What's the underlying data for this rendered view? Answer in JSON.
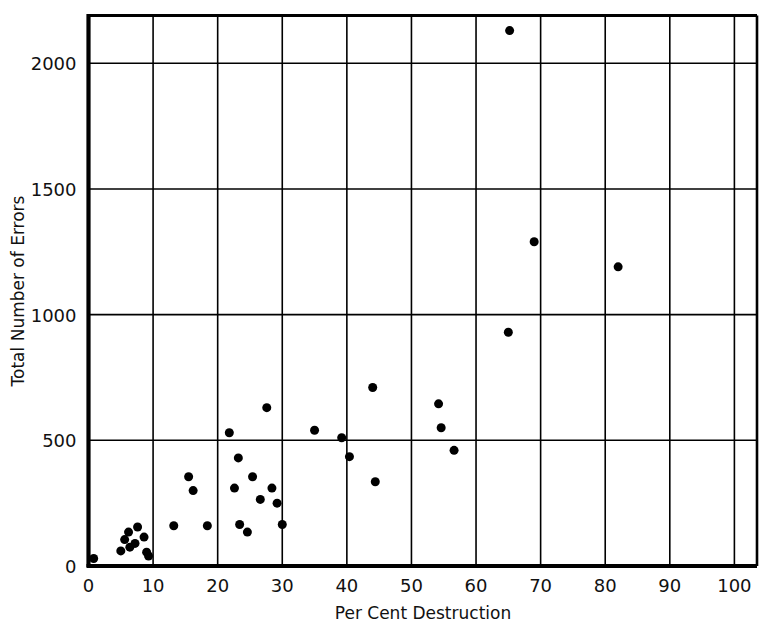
{
  "figure": {
    "background_color": "#ffffff",
    "ink_color": "#000000"
  },
  "chart_data": {
    "type": "scatter",
    "title": "",
    "subtitle": "",
    "xlabel": "Per Cent Destruction",
    "ylabel": "Total Number of Errors",
    "xlim": [
      0,
      103.5
    ],
    "ylim": [
      0,
      2190
    ],
    "grid": true,
    "grid_style": "full rectangular grid, major gridlines only",
    "legend": "none",
    "marker": {
      "shape": "circle",
      "color": "#000000",
      "filled": true,
      "size_px": 9
    },
    "xticks": [
      0,
      10,
      20,
      30,
      40,
      50,
      60,
      70,
      80,
      90,
      100
    ],
    "xtick_labels": [
      "0",
      "10",
      "20",
      "30",
      "40",
      "50",
      "60",
      "70",
      "80",
      "90",
      "100"
    ],
    "yticks": [
      0,
      500,
      1000,
      1500,
      2000
    ],
    "ytick_labels": [
      "0",
      "500",
      "1000",
      "1500",
      "2000"
    ],
    "x_gridlines": [
      10,
      20,
      30,
      40,
      50,
      60,
      70,
      80,
      90,
      100
    ],
    "y_gridlines": [
      500,
      1000,
      1500,
      2000
    ],
    "n_points": 35,
    "points": [
      {
        "x": 0.8,
        "y": 30
      },
      {
        "x": 5.0,
        "y": 60
      },
      {
        "x": 5.6,
        "y": 105
      },
      {
        "x": 6.2,
        "y": 135
      },
      {
        "x": 6.4,
        "y": 75
      },
      {
        "x": 7.2,
        "y": 90
      },
      {
        "x": 7.6,
        "y": 155
      },
      {
        "x": 8.6,
        "y": 115
      },
      {
        "x": 9.0,
        "y": 55
      },
      {
        "x": 9.3,
        "y": 40
      },
      {
        "x": 13.2,
        "y": 160
      },
      {
        "x": 15.5,
        "y": 355
      },
      {
        "x": 16.2,
        "y": 300
      },
      {
        "x": 18.4,
        "y": 160
      },
      {
        "x": 21.8,
        "y": 530
      },
      {
        "x": 22.6,
        "y": 310
      },
      {
        "x": 23.2,
        "y": 430
      },
      {
        "x": 23.4,
        "y": 165
      },
      {
        "x": 24.6,
        "y": 135
      },
      {
        "x": 25.4,
        "y": 355
      },
      {
        "x": 26.6,
        "y": 265
      },
      {
        "x": 27.6,
        "y": 630
      },
      {
        "x": 28.4,
        "y": 310
      },
      {
        "x": 29.2,
        "y": 250
      },
      {
        "x": 30.0,
        "y": 165
      },
      {
        "x": 35.0,
        "y": 540
      },
      {
        "x": 39.2,
        "y": 510
      },
      {
        "x": 40.4,
        "y": 435
      },
      {
        "x": 44.0,
        "y": 710
      },
      {
        "x": 44.4,
        "y": 335
      },
      {
        "x": 54.2,
        "y": 645
      },
      {
        "x": 54.6,
        "y": 550
      },
      {
        "x": 56.6,
        "y": 460
      },
      {
        "x": 65.2,
        "y": 2130
      },
      {
        "x": 65.0,
        "y": 930
      },
      {
        "x": 69.0,
        "y": 1290
      },
      {
        "x": 82.0,
        "y": 1190
      }
    ]
  }
}
